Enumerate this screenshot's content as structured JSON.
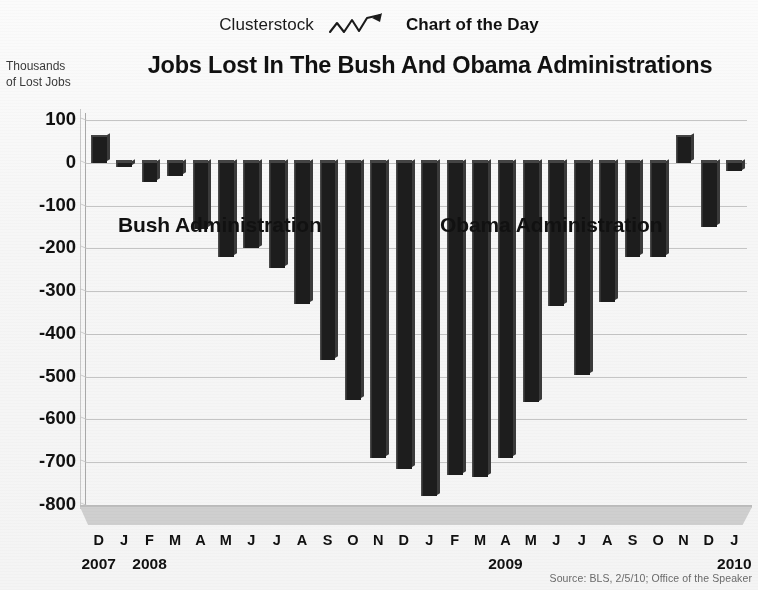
{
  "masthead": {
    "brand": "Clusterstock",
    "series_label": "Chart of the Day",
    "icon": "zigzag-trend-up-icon"
  },
  "header": {
    "title": "Jobs Lost In The Bush And Obama Administrations",
    "yaxis_title_line1": "Thousands",
    "yaxis_title_line2": "of Lost Jobs"
  },
  "annotations": {
    "bush": "Bush Administration",
    "obama": "Obama Administration"
  },
  "source": "Source: BLS, 2/5/10; Office of the Speaker",
  "colors": {
    "bar": "#1d1d1d",
    "gridline": "#bcbcbc",
    "floor": "#cfcfcf",
    "text": "#111111",
    "source_text": "#6a6a6a"
  },
  "chart_data": {
    "type": "bar",
    "title": "Jobs Lost In The Bush And Obama Administrations",
    "subtitle": "",
    "xlabel": "",
    "ylabel": "Thousands of Lost Jobs",
    "ylim": [
      -800,
      100
    ],
    "ytick_values": [
      100,
      0,
      -100,
      -200,
      -300,
      -400,
      -500,
      -600,
      -700,
      -800
    ],
    "ytick_labels": [
      "100",
      "0",
      "-100",
      "-200",
      "-300",
      "-400",
      "-500",
      "-600",
      "-700",
      "-800"
    ],
    "grid": true,
    "legend": null,
    "categories": [
      "D",
      "J",
      "F",
      "M",
      "A",
      "M",
      "J",
      "J",
      "A",
      "S",
      "O",
      "N",
      "D",
      "J",
      "F",
      "M",
      "A",
      "M",
      "J",
      "J",
      "A",
      "S",
      "O",
      "N",
      "D",
      "J"
    ],
    "period_labels": [
      {
        "text": "2007",
        "index": 0
      },
      {
        "text": "2008",
        "index": 2
      },
      {
        "text": "2009",
        "index": 16
      },
      {
        "text": "2010",
        "index": 25
      }
    ],
    "values": [
      60,
      -10,
      -45,
      -30,
      -155,
      -220,
      -200,
      -245,
      -330,
      -460,
      -555,
      -690,
      -715,
      -780,
      -730,
      -735,
      -690,
      -560,
      -335,
      -495,
      -325,
      -220,
      -220,
      60,
      -150,
      -20
    ],
    "administration_spans": [
      {
        "name": "Bush Administration",
        "start_index": 0,
        "end_index": 12
      },
      {
        "name": "Obama Administration",
        "start_index": 13,
        "end_index": 25
      }
    ]
  }
}
